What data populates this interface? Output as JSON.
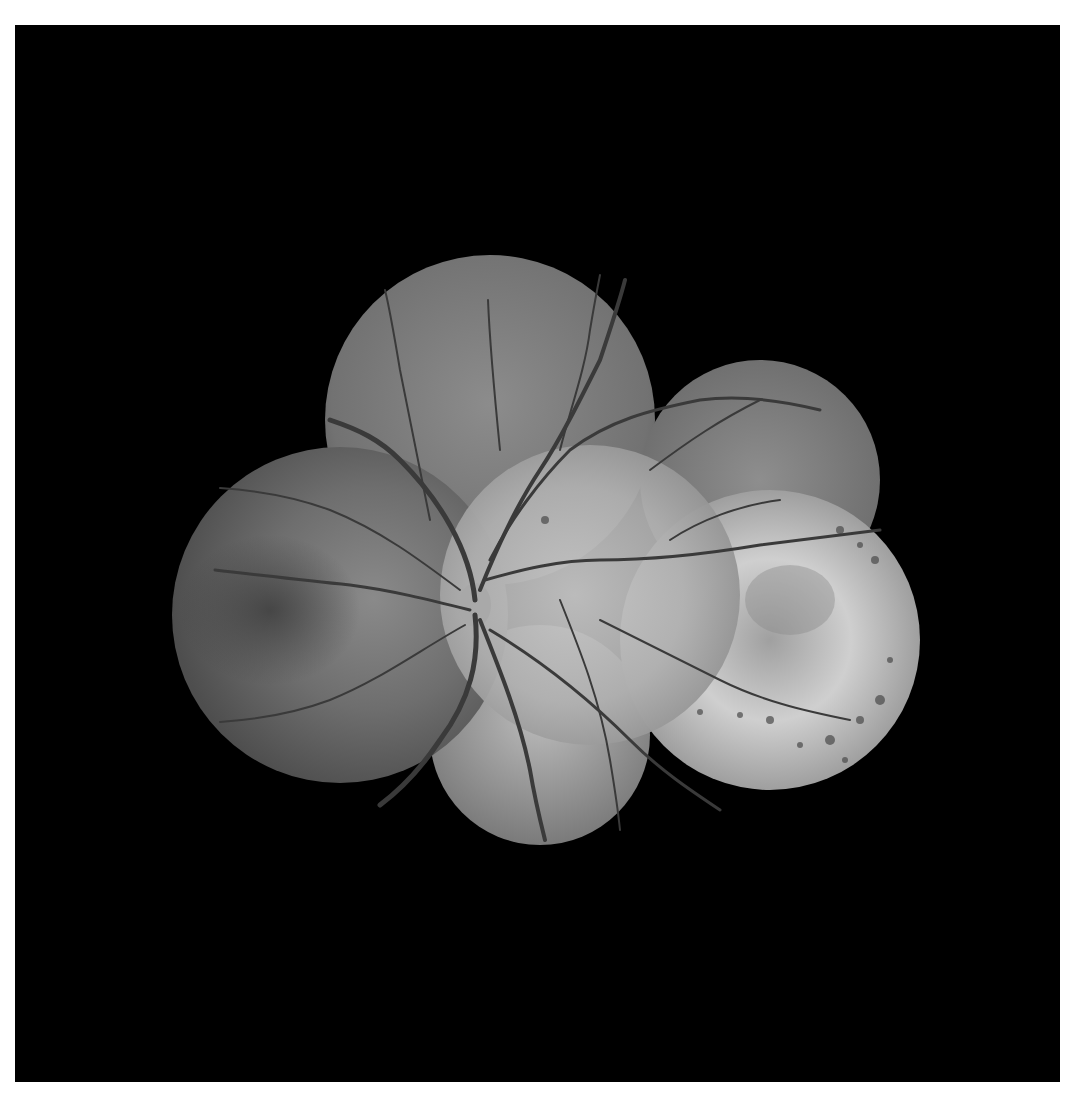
{
  "image": {
    "kind": "fundus-photo-montage",
    "description": "Grayscale wide-field retinal fundus montage composed of six overlapping circular photographs on a black background",
    "background_color": "#000000",
    "frame_color": "#ffffff",
    "fields": [
      {
        "name": "superior",
        "cx": 490,
        "cy": 420,
        "r": 165
      },
      {
        "name": "superotemporal",
        "cx": 760,
        "cy": 480,
        "r": 120
      },
      {
        "name": "left-nasal",
        "cx": 340,
        "cy": 615,
        "r": 168
      },
      {
        "name": "central-posterior-pole",
        "cx": 590,
        "cy": 595,
        "r": 150
      },
      {
        "name": "right-temporal-lesion",
        "cx": 770,
        "cy": 640,
        "r": 150
      },
      {
        "name": "inferior",
        "cx": 540,
        "cy": 735,
        "r": 110
      }
    ],
    "features": {
      "optic_disc": {
        "x": 470,
        "y": 610
      },
      "pigmented_lesion_region": {
        "x": 790,
        "y": 630
      }
    }
  }
}
